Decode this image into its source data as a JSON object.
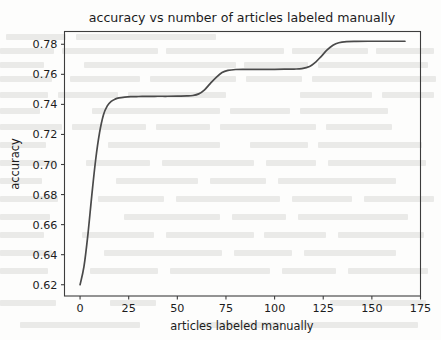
{
  "figure": {
    "background_color": "#fdfdfc",
    "line_color": "#4a4a4a",
    "axis_color": "#3d3d3d",
    "text_color": "#1c1c1c"
  },
  "chart_data": {
    "type": "line",
    "title": "accuracy vs number of articles labeled manually",
    "xlabel": "articles labeled manually",
    "ylabel": "accuracy",
    "xlim": [
      -8,
      175
    ],
    "ylim": [
      0.6125,
      0.7885
    ],
    "grid": false,
    "legend": null,
    "xticks": [
      0,
      25,
      50,
      75,
      100,
      125,
      150,
      175
    ],
    "xticklabels": [
      "0",
      "25",
      "50",
      "75",
      "100",
      "125",
      "150",
      "175"
    ],
    "yticks": [
      0.62,
      0.64,
      0.66,
      0.68,
      0.7,
      0.72,
      0.74,
      0.76,
      0.78
    ],
    "yticklabels": [
      "0.62",
      "0.64",
      "0.66",
      "0.68",
      "0.70",
      "0.72",
      "0.74",
      "0.76",
      "0.78"
    ],
    "series": [
      {
        "name": "accuracy",
        "color": "#4a4a4a",
        "x": [
          0,
          2,
          4,
          6,
          8,
          10,
          12,
          14,
          16,
          18,
          20,
          23,
          26,
          29,
          32,
          35,
          40,
          45,
          50,
          55,
          58,
          61,
          64,
          67,
          70,
          73,
          76,
          80,
          85,
          90,
          95,
          100,
          105,
          110,
          114,
          118,
          121,
          124,
          127,
          130,
          133,
          137,
          142,
          148,
          155,
          161,
          167
        ],
        "y": [
          0.62,
          0.632,
          0.653,
          0.679,
          0.703,
          0.721,
          0.733,
          0.739,
          0.742,
          0.7435,
          0.7443,
          0.7448,
          0.7451,
          0.7452,
          0.7453,
          0.7453,
          0.7454,
          0.7454,
          0.7455,
          0.7456,
          0.7459,
          0.747,
          0.7497,
          0.754,
          0.758,
          0.7612,
          0.7626,
          0.7632,
          0.7633,
          0.7633,
          0.7633,
          0.7633,
          0.7634,
          0.7635,
          0.7638,
          0.7652,
          0.768,
          0.772,
          0.7762,
          0.7793,
          0.781,
          0.7817,
          0.7819,
          0.782,
          0.782,
          0.782,
          0.782
        ]
      }
    ],
    "annotations": {
      "first_plateau_value": 0.7454,
      "second_plateau_value": 0.7633,
      "final_plateau_value": 0.782,
      "start_value": 0.62,
      "x_data_max": 167
    }
  },
  "background_artifacts": {
    "description": "faint scanned-page bleed-through text behind the plot",
    "visible": true
  }
}
